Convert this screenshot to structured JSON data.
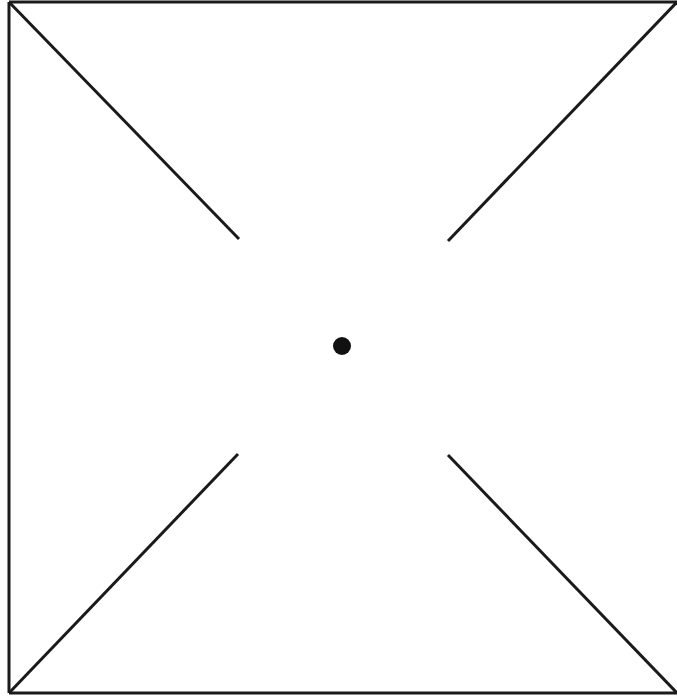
{
  "diagram": {
    "canvas": {
      "width": 677,
      "height": 698,
      "background": "#ffffff"
    },
    "stroke_color": "#1a1a1a",
    "stroke_width": 3,
    "frame": {
      "top_edge": {
        "x1": 9,
        "y1": 2,
        "x2": 677,
        "y2": 2
      },
      "left_edge": {
        "x1": 9,
        "y1": 2,
        "x2": 9,
        "y2": 693
      },
      "bottom_edge": {
        "x1": 9,
        "y1": 693,
        "x2": 677,
        "y2": 693
      }
    },
    "diagonals": [
      {
        "name": "diagonal-top-left",
        "x1": 9,
        "y1": 2,
        "x2": 239,
        "y2": 239
      },
      {
        "name": "diagonal-top-right",
        "x1": 677,
        "y1": 2,
        "x2": 448,
        "y2": 241
      },
      {
        "name": "diagonal-bottom-left",
        "x1": 9,
        "y1": 693,
        "x2": 238,
        "y2": 454
      },
      {
        "name": "diagonal-bottom-right",
        "x1": 677,
        "y1": 693,
        "x2": 448,
        "y2": 455
      }
    ],
    "center_dot": {
      "cx": 342,
      "cy": 346,
      "r": 9,
      "fill": "#111111"
    }
  }
}
